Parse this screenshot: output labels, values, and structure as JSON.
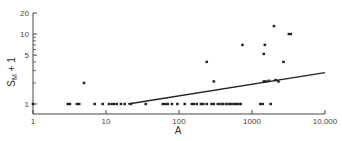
{
  "chart_data": {
    "type": "scatter",
    "title": "",
    "xlabel": "A",
    "ylabel": "S_M + 1",
    "ylabel_parts": {
      "main": "S",
      "sub": "M",
      "suffix": " + 1"
    },
    "xscale": "log",
    "yscale": "log",
    "xlim": [
      1,
      10000
    ],
    "ylim": [
      1,
      20
    ],
    "grid": false,
    "legend": null,
    "x_ticks": [
      {
        "value": 1,
        "label": "1"
      },
      {
        "value": 10,
        "label": "10"
      },
      {
        "value": 100,
        "label": "100"
      },
      {
        "value": 1000,
        "label": "1000"
      },
      {
        "value": 10000,
        "label": "10,000"
      }
    ],
    "y_ticks": [
      {
        "value": 1,
        "label": "1"
      },
      {
        "value": 5,
        "label": "5"
      },
      {
        "value": 10,
        "label": "10"
      },
      {
        "value": 20,
        "label": "20"
      }
    ],
    "y_minor_ticks": [
      2,
      3,
      4,
      6,
      7,
      8,
      9
    ],
    "series": [
      {
        "name": "observations",
        "kind": "points",
        "points": [
          [
            1,
            1
          ],
          [
            3,
            1
          ],
          [
            3.2,
            1
          ],
          [
            4,
            1
          ],
          [
            4.3,
            1
          ],
          [
            7,
            1
          ],
          [
            9,
            1
          ],
          [
            11,
            1
          ],
          [
            12,
            1
          ],
          [
            13,
            1
          ],
          [
            14,
            1
          ],
          [
            16,
            1
          ],
          [
            18,
            1
          ],
          [
            22,
            1
          ],
          [
            35,
            1
          ],
          [
            60,
            1
          ],
          [
            65,
            1
          ],
          [
            70,
            1
          ],
          [
            80,
            1
          ],
          [
            95,
            1
          ],
          [
            120,
            1
          ],
          [
            150,
            1
          ],
          [
            160,
            1
          ],
          [
            175,
            1
          ],
          [
            200,
            1
          ],
          [
            215,
            1
          ],
          [
            240,
            1
          ],
          [
            280,
            1
          ],
          [
            300,
            1
          ],
          [
            340,
            1
          ],
          [
            370,
            1
          ],
          [
            400,
            1
          ],
          [
            440,
            1
          ],
          [
            480,
            1
          ],
          [
            520,
            1
          ],
          [
            560,
            1
          ],
          [
            600,
            1
          ],
          [
            650,
            1
          ],
          [
            700,
            1
          ],
          [
            1300,
            1
          ],
          [
            1400,
            1
          ],
          [
            1800,
            1
          ],
          [
            5,
            2
          ],
          [
            300,
            2.1
          ],
          [
            240,
            4
          ],
          [
            740,
            7
          ],
          [
            1500,
            7
          ],
          [
            1450,
            5.2
          ],
          [
            2000,
            13
          ],
          [
            2700,
            4
          ],
          [
            3200,
            10
          ],
          [
            3400,
            10
          ],
          [
            1450,
            2.1
          ],
          [
            1550,
            2.1
          ],
          [
            1700,
            2.15
          ],
          [
            2100,
            2.2
          ],
          [
            2300,
            2.1
          ]
        ]
      },
      {
        "name": "regression line",
        "kind": "line",
        "points": [
          [
            20,
            1
          ],
          [
            10000,
            2.8
          ]
        ]
      }
    ]
  },
  "colors": {
    "ink": "#222222",
    "axis": "#444444",
    "background": "#ffffff"
  }
}
